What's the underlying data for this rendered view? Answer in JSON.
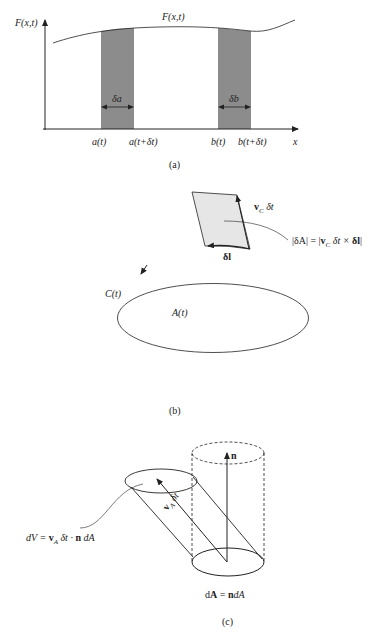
{
  "figure": {
    "panel_a": {
      "caption": "(a)",
      "y_axis_label": "F(x,t)",
      "curve_label": "F(x,t)",
      "x_axis_label": "x",
      "ticks": [
        "a(t)",
        "a(t+δt)",
        "b(t)",
        "b(t+δt)"
      ],
      "strip_labels": [
        "δa",
        "δb"
      ],
      "shade_color": "#8c8c8c"
    },
    "panel_b": {
      "caption": "(b)",
      "curve_label": "C(t)",
      "area_label": "A(t)",
      "element_label": "δl",
      "velocity_label_v": "v",
      "velocity_label_sub": "C",
      "velocity_label_tail": " δt",
      "area_formula_pre": "|δA| = |",
      "area_formula_v": "v",
      "area_formula_sub": "C",
      "area_formula_mid": " δt × ",
      "area_formula_l": "δl",
      "area_formula_post": "|",
      "shade_color": "#e6e6e6"
    },
    "panel_c": {
      "caption": "(c)",
      "normal_label": "n",
      "velocity_label_v": "v",
      "velocity_label_sub": "A",
      "velocity_label_tail": " δt",
      "volume_formula_pre": "dV = ",
      "volume_formula_v": "v",
      "volume_formula_sub": "A",
      "volume_formula_mid": " δt · ",
      "volume_formula_n": "n",
      "volume_formula_post": " dA",
      "area_formula_pre": "d",
      "area_formula_A": "A",
      "area_formula_mid": " = ",
      "area_formula_n": "n",
      "area_formula_post": "dA"
    }
  }
}
